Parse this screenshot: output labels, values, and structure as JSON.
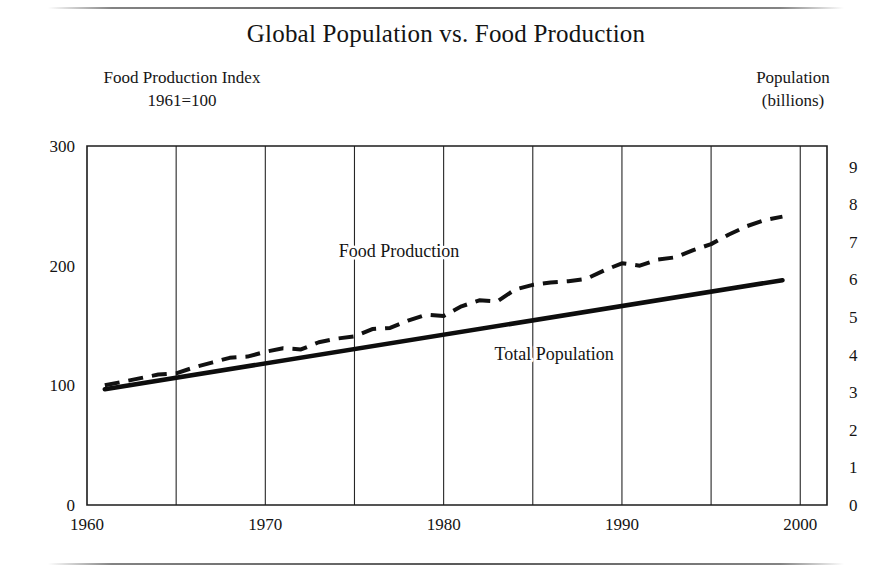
{
  "figure": {
    "title": "Global Population vs. Food Production",
    "left_axis_title_line1": "Food Production Index",
    "left_axis_title_line2": "1961=100",
    "right_axis_title_line1": "Population",
    "right_axis_title_line2": "(billions)",
    "background_color": "#ffffff",
    "ink_color": "#1a1a1a"
  },
  "chart_data": {
    "type": "line",
    "title": "Global Population vs. Food Production",
    "xlabel": "",
    "ylabel": "Food Production Index 1961=100",
    "y2label": "Population (billions)",
    "xlim": [
      1960,
      2001.5
    ],
    "ylim": [
      0,
      300
    ],
    "y2lim": [
      0,
      9.55
    ],
    "grid": "vertical",
    "legend": "inline-annotations",
    "x_ticks": [
      1960,
      1970,
      1980,
      1990,
      2000
    ],
    "x_tick_labels": [
      "1960",
      "1970",
      "1980",
      "1990",
      "2000"
    ],
    "x_gridlines": [
      1965,
      1970,
      1975,
      1980,
      1985,
      1990,
      1995,
      2000
    ],
    "y_ticks": [
      0,
      100,
      200,
      300
    ],
    "y_tick_labels": [
      "0",
      "100",
      "200",
      "300"
    ],
    "y2_ticks": [
      0,
      1,
      2,
      3,
      4,
      5,
      6,
      7,
      8,
      9
    ],
    "y2_tick_labels": [
      "0",
      "1",
      "2",
      "3",
      "4",
      "5",
      "6",
      "7",
      "8",
      "9"
    ],
    "series": [
      {
        "name": "Food Production",
        "axis": "left",
        "style": "dashed",
        "color": "#111111",
        "label_text": "Food Production",
        "label_x": 1977.5,
        "label_y": 207,
        "x": [
          1961,
          1962,
          1963,
          1964,
          1965,
          1966,
          1967,
          1968,
          1969,
          1970,
          1971,
          1972,
          1973,
          1974,
          1975,
          1976,
          1977,
          1978,
          1979,
          1980,
          1981,
          1982,
          1983,
          1984,
          1985,
          1986,
          1987,
          1988,
          1989,
          1990,
          1991,
          1992,
          1993,
          1994,
          1995,
          1996,
          1997,
          1998,
          1999
        ],
        "values": [
          100,
          103,
          106,
          109,
          110,
          115,
          119,
          123,
          124,
          128,
          131,
          130,
          136,
          139,
          141,
          147,
          148,
          154,
          159,
          158,
          166,
          171,
          170,
          180,
          184,
          186,
          187,
          189,
          196,
          202,
          200,
          205,
          207,
          213,
          218,
          226,
          233,
          238,
          241
        ]
      },
      {
        "name": "Total Population",
        "axis": "right",
        "style": "solid",
        "color": "#0d0d0d",
        "label_text": "Total Population",
        "label_x": 1986.2,
        "label_y_right_axis": 3.62,
        "x": [
          1961,
          1999
        ],
        "values_billions": [
          3.08,
          5.98
        ],
        "values_left_axis_equivalent": [
          97,
          188
        ]
      }
    ],
    "annotations": [
      {
        "text": "Food Production",
        "x": 1977.5,
        "y": 207
      },
      {
        "text": "Total Population",
        "x": 1986.2,
        "y": 121
      }
    ]
  },
  "geometry": {
    "plot_left_px": 87,
    "plot_right_px": 827,
    "plot_top_px": 146,
    "plot_bottom_px": 505,
    "year_2000_gridline_px": 803
  }
}
